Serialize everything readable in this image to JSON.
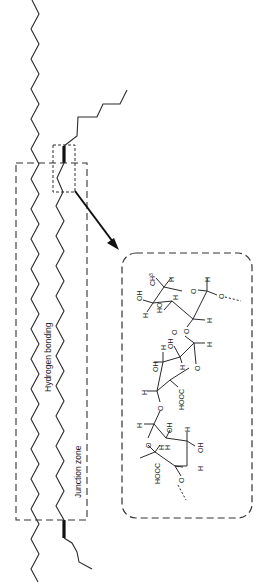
{
  "diagram": {
    "type": "schematic",
    "labels": {
      "hydrogen_bonding": "Hydrogen bonding",
      "junction_zone": "Junction zone"
    },
    "molecule_atoms": {
      "ch3": "CH",
      "ch3_sub": "3",
      "oh": "OH",
      "ho": "HO",
      "h": "H",
      "o": "O",
      "hooc": "HOOC"
    },
    "elements": [
      "left-polymer-chain",
      "right-polymer-chain-with-branches",
      "hydrogen-bonding-dashed-region",
      "junction-zone-detail-box",
      "zoom-arrow",
      "molecular-structure-inset"
    ],
    "colors": {
      "line": "#2a2a2a",
      "background": "#ffffff"
    }
  }
}
